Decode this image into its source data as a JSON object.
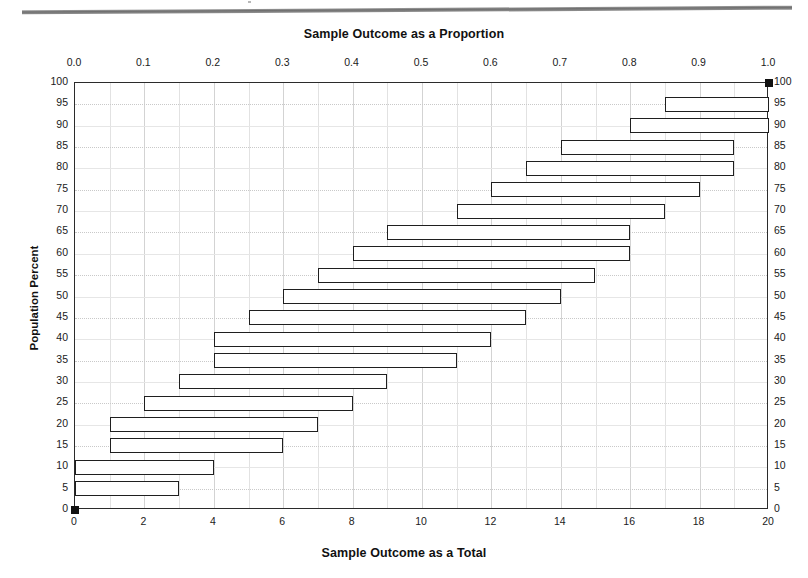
{
  "titles": {
    "top_axis_title": "Sample Outcome as a Proportion",
    "bottom_axis_title": "Sample Outcome as a Total",
    "y_axis_title": "Population Percent"
  },
  "chart_data": {
    "type": "bar",
    "orientation": "horizontal",
    "title": "Sample Outcome as a Proportion",
    "xlabel": "Sample Outcome as a Total",
    "ylabel": "Population Percent",
    "grid": true,
    "legend": "none",
    "x_axis_bottom": {
      "label": "Sample Outcome as a Total",
      "min": 0,
      "max": 20,
      "step": 2,
      "ticks": [
        "0",
        "2",
        "4",
        "6",
        "8",
        "10",
        "12",
        "14",
        "16",
        "18",
        "20"
      ]
    },
    "x_axis_top": {
      "label": "Sample Outcome as a Proportion",
      "min": 0.0,
      "max": 1.0,
      "step": 0.1,
      "ticks": [
        "0.0",
        "0.1",
        "0.2",
        "0.3",
        "0.4",
        "0.5",
        "0.6",
        "0.7",
        "0.8",
        "0.9",
        "1.0"
      ]
    },
    "y_axis": {
      "label": "Population Percent",
      "min": 0,
      "max": 100,
      "step": 5,
      "ticks": [
        "0",
        "5",
        "10",
        "15",
        "20",
        "25",
        "30",
        "35",
        "40",
        "45",
        "50",
        "55",
        "60",
        "65",
        "70",
        "75",
        "80",
        "85",
        "90",
        "95",
        "100"
      ]
    },
    "categories": [
      0,
      5,
      10,
      15,
      20,
      25,
      30,
      35,
      40,
      45,
      50,
      55,
      60,
      65,
      70,
      75,
      80,
      85,
      90,
      95,
      100
    ],
    "intervals": [
      {
        "population_percent": 0,
        "low": 0,
        "high": 0
      },
      {
        "population_percent": 5,
        "low": 0,
        "high": 3
      },
      {
        "population_percent": 10,
        "low": 0,
        "high": 4
      },
      {
        "population_percent": 15,
        "low": 1,
        "high": 6
      },
      {
        "population_percent": 20,
        "low": 1,
        "high": 7
      },
      {
        "population_percent": 25,
        "low": 2,
        "high": 8
      },
      {
        "population_percent": 30,
        "low": 3,
        "high": 9
      },
      {
        "population_percent": 35,
        "low": 4,
        "high": 11
      },
      {
        "population_percent": 40,
        "low": 4,
        "high": 12
      },
      {
        "population_percent": 45,
        "low": 5,
        "high": 13
      },
      {
        "population_percent": 50,
        "low": 6,
        "high": 14
      },
      {
        "population_percent": 55,
        "low": 7,
        "high": 15
      },
      {
        "population_percent": 60,
        "low": 8,
        "high": 16
      },
      {
        "population_percent": 65,
        "low": 9,
        "high": 16
      },
      {
        "population_percent": 70,
        "low": 11,
        "high": 17
      },
      {
        "population_percent": 75,
        "low": 12,
        "high": 18
      },
      {
        "population_percent": 80,
        "low": 13,
        "high": 19
      },
      {
        "population_percent": 85,
        "low": 14,
        "high": 19
      },
      {
        "population_percent": 90,
        "low": 16,
        "high": 20
      },
      {
        "population_percent": 95,
        "low": 17,
        "high": 20
      },
      {
        "population_percent": 100,
        "low": 20,
        "high": 20
      }
    ]
  },
  "colors": {
    "bar_outline": "#1f1f1f",
    "bar_fill": "#ffffff",
    "grid": "#d3d3d3",
    "axis": "#2b2b2b",
    "text": "#111111",
    "top_rule": "#6e6e6e"
  }
}
